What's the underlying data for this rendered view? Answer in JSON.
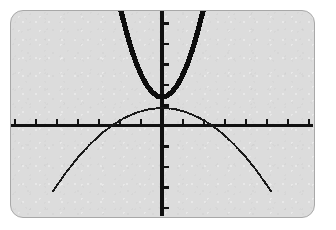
{
  "screen": {
    "label": "graphing-calculator-screen",
    "background_color": "#dcdcdc",
    "border_color": "#a8a8a8",
    "corner_radius_px": 13
  },
  "chart_data": {
    "type": "line",
    "title": "",
    "subtitle": "",
    "xlabel": "",
    "ylabel": "",
    "xlim": [
      -7.2,
      7.2
    ],
    "ylim": [
      -4.4,
      5.6
    ],
    "grid": false,
    "legend": false,
    "legend_position": "none",
    "axes": {
      "x_axis": {
        "name": "x-axis",
        "visible": true,
        "y_value": 0,
        "x_start": -7.2,
        "x_end": 7.2,
        "tick_spacing": 1,
        "tick_direction": "up",
        "tick_values": [
          -7,
          -6,
          -5,
          -4,
          -3,
          -2,
          -1,
          1,
          2,
          3,
          4,
          5,
          6,
          7
        ],
        "tick_labels_shown": false
      },
      "y_axis": {
        "name": "y-axis",
        "visible": true,
        "x_value": 0,
        "y_start": -4.4,
        "y_end": 5.6,
        "tick_spacing": 1,
        "tick_direction": "right",
        "tick_values": [
          -4,
          -3,
          -2,
          -1,
          1,
          2,
          3,
          4,
          5
        ],
        "tick_labels_shown": false
      }
    },
    "series": [
      {
        "name": "upward-parabola",
        "style": "thick-solid",
        "color": "#0d0d0d",
        "opens": "up",
        "vertex": [
          0,
          1.4
        ],
        "x_intercepts": [],
        "y_intercept": 1.4,
        "leading_coefficient": 1.1,
        "equation": "y = 1.1x^2 + 1.4",
        "x": [
          -1.95,
          -1.7,
          -1.45,
          -1.2,
          -0.95,
          -0.7,
          -0.45,
          -0.2,
          0,
          0.2,
          0.45,
          0.7,
          0.95,
          1.2,
          1.45,
          1.7,
          1.95
        ],
        "y": [
          5.58,
          4.58,
          3.71,
          2.98,
          2.39,
          1.94,
          1.62,
          1.44,
          1.4,
          1.44,
          1.62,
          1.94,
          2.39,
          2.98,
          3.71,
          4.58,
          5.58
        ]
      },
      {
        "name": "downward-parabola",
        "style": "thin-dotted",
        "color": "#1a1a1a",
        "opens": "down",
        "vertex": [
          0,
          0.87
        ],
        "x_intercepts": [
          -2.4,
          2.4
        ],
        "y_intercept": 0.87,
        "leading_coefficient": -0.15,
        "equation": "y = -0.15x^2 + 0.87",
        "x": [
          -5.2,
          -4.6,
          -4.0,
          -3.4,
          -2.8,
          -2.4,
          -1.8,
          -1.2,
          -0.6,
          0,
          0.6,
          1.2,
          1.8,
          2.4,
          2.8,
          3.4,
          4.0,
          4.6,
          5.2
        ],
        "y": [
          -3.19,
          -2.31,
          -1.53,
          -0.87,
          -0.31,
          0,
          0.38,
          0.65,
          0.82,
          0.87,
          0.82,
          0.65,
          0.38,
          0,
          -0.31,
          -0.87,
          -1.53,
          -2.31,
          -3.19
        ]
      }
    ]
  }
}
